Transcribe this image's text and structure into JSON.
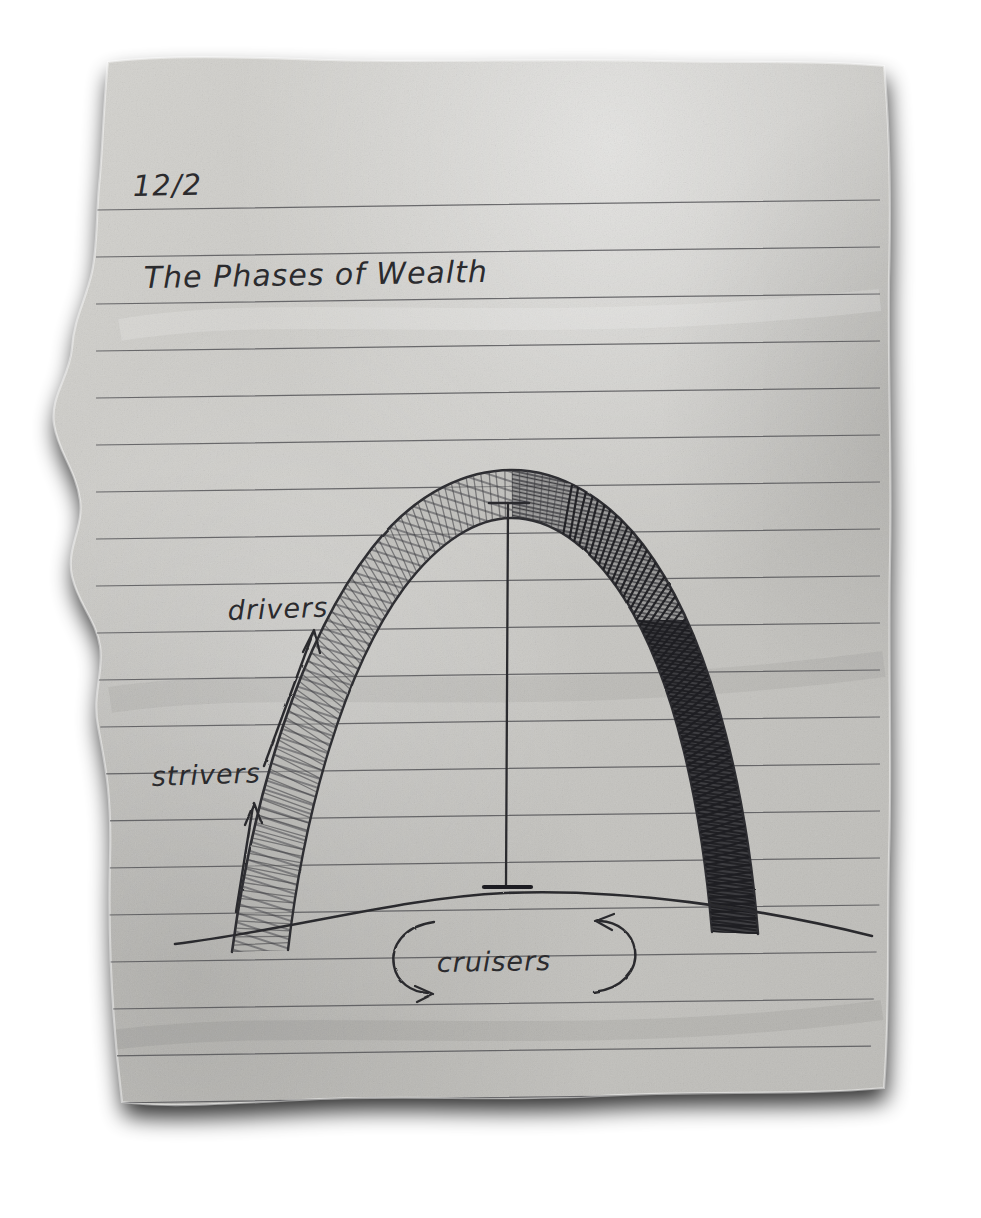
{
  "medium": {
    "surface": "torn-ruled-notebook-paper",
    "ink": "black-ballpoint-and-pencil",
    "paper_color": "#c9c8c4",
    "rule_color": "#4c4c50",
    "ink_color": "#2b2b2e"
  },
  "notebook": {
    "date": "12/2",
    "title": "The Phases of Wealth",
    "ruled_line_count": 22,
    "rule_spacing_px": 47
  },
  "chart_data": {
    "type": "line",
    "title": "The Phases of Wealth",
    "subtitle": "12/2",
    "xlabel": "",
    "ylabel": "",
    "grid": false,
    "legend_position": "inline-annotations",
    "annotations": [
      {
        "label": "strivers",
        "phase": 1,
        "position": "lower-left-leg",
        "marker": "straight-up-arrow",
        "meaning": "early steep climb at the base of the arch"
      },
      {
        "label": "drivers",
        "phase": 2,
        "position": "upper-left-leg",
        "marker": "straight-up-arrow",
        "meaning": "accelerating climb toward the apex"
      },
      {
        "label": "cruisers",
        "phase": 3,
        "position": "bottom-center",
        "marker": "two-curved-arrows-parentheses",
        "meaning": "flat steady base beneath the arch"
      }
    ],
    "series": [
      {
        "name": "arch",
        "shape": "inverted-catenary",
        "apex": {
          "x": 510,
          "y": 478
        },
        "left_foot": {
          "x": 232,
          "y": 950
        },
        "right_foot": {
          "x": 745,
          "y": 930
        },
        "shading": "left-leg-light-hatch, right-leg-dark-solid-hatch"
      },
      {
        "name": "ground-hill",
        "shape": "broad-low-arc",
        "left_end": {
          "x": 175,
          "y": 944
        },
        "crest": {
          "x": 505,
          "y": 893
        },
        "right_end": {
          "x": 872,
          "y": 936
        }
      },
      {
        "name": "height-measure-line",
        "shape": "vertical-line-with-serif-caps",
        "top": {
          "x": 508,
          "y": 503
        },
        "bottom": {
          "x": 506,
          "y": 886
        }
      }
    ]
  },
  "labels": {
    "date": "12/2",
    "title": "The Phases of Wealth",
    "drivers": "drivers",
    "strivers": "strivers",
    "cruisers": "cruisers"
  }
}
